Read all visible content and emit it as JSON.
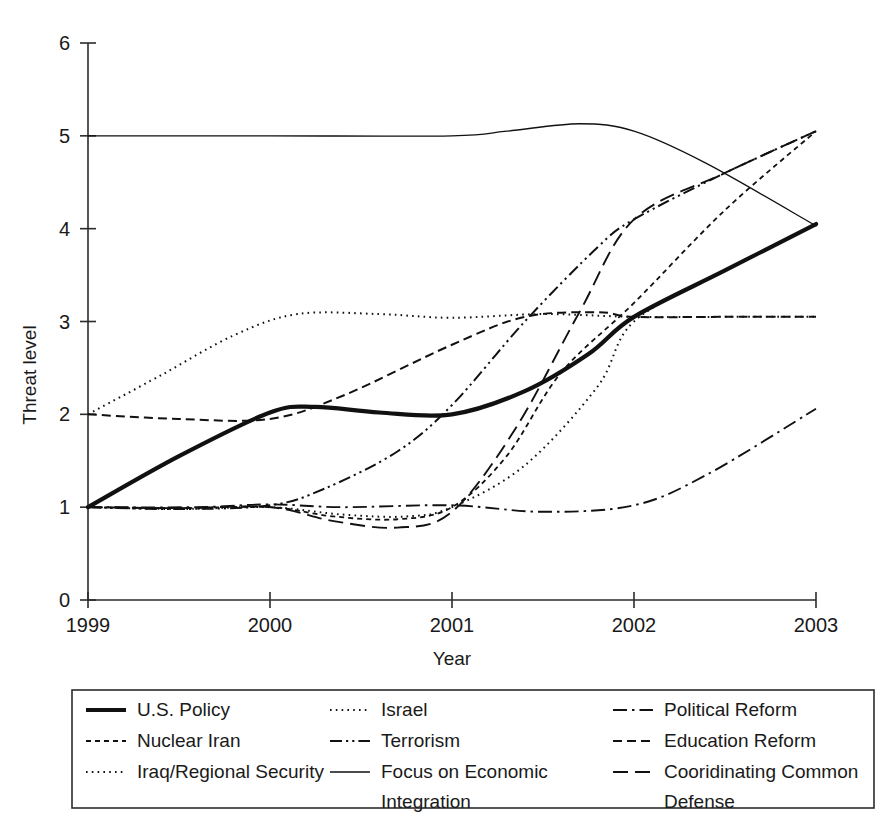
{
  "chart_data": {
    "type": "line",
    "title": "",
    "xlabel": "Year",
    "ylabel": "Threat level",
    "xlim": [
      1999,
      2003
    ],
    "ylim": [
      0,
      6
    ],
    "grid": false,
    "legend_position": "bottom",
    "x_ticks": [
      "1999",
      "2000",
      "2001",
      "2002",
      "2003"
    ],
    "y_ticks": [
      "0",
      "1",
      "2",
      "3",
      "4",
      "5",
      "6"
    ],
    "x": [
      1999,
      2003
    ],
    "series": [
      {
        "name": "U.S. Policy",
        "style": "thick-solid",
        "x": [
          1999,
          1999.5,
          2000,
          2000.25,
          2000.6,
          2001,
          2001.4,
          2001.75,
          2002,
          2002.5,
          2003
        ],
        "values": [
          1.0,
          1.55,
          2.02,
          2.08,
          2.02,
          2.0,
          2.25,
          2.65,
          3.05,
          3.55,
          4.05
        ]
      },
      {
        "name": "Nuclear Iran",
        "style": "fine-dashed",
        "x": [
          1999,
          1999.5,
          2000,
          2000.35,
          2000.7,
          2001,
          2001.3,
          2001.6,
          2002,
          2002.5,
          2003
        ],
        "values": [
          1.0,
          0.99,
          1.0,
          0.9,
          0.87,
          1.0,
          1.55,
          2.45,
          3.2,
          4.2,
          5.05
        ]
      },
      {
        "name": "Iraq/Regional Security",
        "style": "dotted",
        "x": [
          1999,
          1999.4,
          1999.8,
          2000.15,
          2000.6,
          2001,
          2001.5,
          2002,
          2002.5,
          2003
        ],
        "values": [
          2.0,
          2.42,
          2.85,
          3.08,
          3.08,
          3.04,
          3.08,
          3.05,
          3.05,
          3.05
        ]
      },
      {
        "name": "Israel",
        "style": "dotted",
        "x": [
          1999,
          1999.5,
          2000,
          2000.4,
          2000.75,
          2001,
          2001.4,
          2001.8,
          2002,
          2002.5,
          2003
        ],
        "values": [
          1.0,
          0.98,
          1.0,
          0.92,
          0.9,
          1.0,
          1.45,
          2.3,
          3.0,
          3.55,
          4.05
        ]
      },
      {
        "name": "Terrorism",
        "style": "dash-dot-dot",
        "x": [
          1999,
          1999.5,
          2000,
          2000.3,
          2000.7,
          2001,
          2001.4,
          2001.8,
          2002,
          2002.5,
          2003
        ],
        "values": [
          1.0,
          0.98,
          1.02,
          1.2,
          1.6,
          2.1,
          3.0,
          3.8,
          4.1,
          4.6,
          5.05
        ]
      },
      {
        "name": "Focus on Economic Integration",
        "style": "thin-solid",
        "x": [
          1999,
          2000,
          2001,
          2001.3,
          2001.7,
          2002,
          2002.4,
          2003
        ],
        "values": [
          5.0,
          5.0,
          5.0,
          5.05,
          5.13,
          5.05,
          4.7,
          4.03
        ]
      },
      {
        "name": "Political Reform",
        "style": "dash-dot",
        "x": [
          1999,
          1999.6,
          2000,
          2000.4,
          2001,
          2001.5,
          2002,
          2002.4,
          2003
        ],
        "values": [
          1.0,
          1.0,
          1.03,
          1.0,
          1.02,
          0.95,
          1.02,
          1.35,
          2.06
        ]
      },
      {
        "name": "Education Reform",
        "style": "dashed",
        "x": [
          1999,
          1999.5,
          2000,
          2000.4,
          2001,
          2001.4,
          2001.8,
          2002,
          2002.5,
          2003
        ],
        "values": [
          2.0,
          1.95,
          1.95,
          2.2,
          2.75,
          3.05,
          3.1,
          3.05,
          3.05,
          3.05
        ]
      },
      {
        "name": "Cooridinating Common Defense",
        "style": "long-dashed",
        "x": [
          1999,
          1999.5,
          2000,
          2000.35,
          2000.7,
          2001,
          2001.35,
          2001.7,
          2002,
          2002.5,
          2003
        ],
        "values": [
          1.0,
          0.99,
          1.0,
          0.85,
          0.78,
          0.95,
          1.85,
          3.1,
          4.1,
          4.6,
          5.05
        ]
      }
    ]
  },
  "axes": {
    "y_label": "Threat level",
    "x_label": "Year",
    "y_ticks": [
      "6",
      "5",
      "4",
      "3",
      "2",
      "1",
      "0"
    ],
    "x_ticks": [
      "1999",
      "2000",
      "2001",
      "2002",
      "2003"
    ]
  },
  "legend": {
    "columns": [
      {
        "entries": [
          {
            "label": "U.S. Policy",
            "style": "thick-solid"
          },
          {
            "label": "Nuclear Iran",
            "style": "fine-dashed"
          },
          {
            "label": "Iraq/Regional Security",
            "style": "dotted"
          }
        ]
      },
      {
        "entries": [
          {
            "label": "Israel",
            "style": "dotted"
          },
          {
            "label": "Terrorism",
            "style": "dash-dot-dot"
          },
          {
            "label": "Focus on Economic",
            "label2": "Integration",
            "style": "thin-solid"
          }
        ]
      },
      {
        "entries": [
          {
            "label": "Political Reform",
            "style": "dash-dot"
          },
          {
            "label": "Education Reform",
            "style": "dashed"
          },
          {
            "label": "Cooridinating Common",
            "label2": "Defense",
            "style": "long-dashed"
          }
        ]
      }
    ]
  },
  "colors": {
    "ink": "#111111",
    "axis": "#2b2b2b",
    "background": "#ffffff"
  }
}
